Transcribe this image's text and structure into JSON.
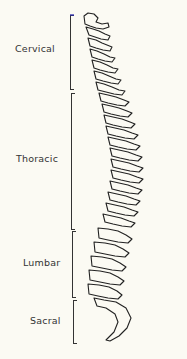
{
  "diagram": {
    "regions": [
      {
        "label": "Cervical",
        "top": 15,
        "bottom": 88,
        "label_x": 15,
        "label_y": 43
      },
      {
        "label": "Thoracic",
        "top": 93,
        "bottom": 228,
        "label_x": 16,
        "label_y": 153
      },
      {
        "label": "Lumbar",
        "top": 231,
        "bottom": 296,
        "label_x": 23,
        "label_y": 257
      },
      {
        "label": "Sacral",
        "top": 300,
        "bottom": 342,
        "label_x": 30,
        "label_y": 315
      }
    ],
    "colors": {
      "line": "#222222",
      "background": "#fbfaf3",
      "accent": "#2a2ab0"
    }
  }
}
